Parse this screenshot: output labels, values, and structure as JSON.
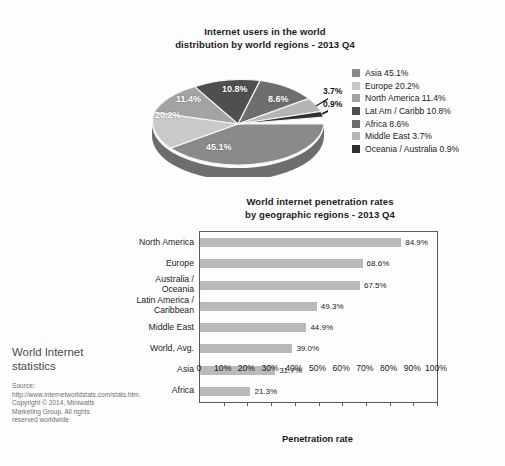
{
  "pie": {
    "title_line1": "Internet users in the world",
    "title_line2": "distribution by world regions - 2013 Q4",
    "slice_labels": {
      "asia": "45.1%",
      "europe": "20.2%",
      "north_america": "11.4%",
      "latam": "10.8%",
      "africa": "8.6%",
      "middle_east": "3.7%",
      "oceania": "0.9%"
    },
    "legend": [
      {
        "label": "Asia 45.1%",
        "color": "#8a8a8a"
      },
      {
        "label": "Europe 20.2%",
        "color": "#c9c9c9"
      },
      {
        "label": "North America 11.4%",
        "color": "#a3a3a3"
      },
      {
        "label": "Lat Am / Caribb 10.8%",
        "color": "#4f4f4f"
      },
      {
        "label": "Africa 8.6%",
        "color": "#6e6e6e"
      },
      {
        "label": "Middle East 3.7%",
        "color": "#b5b5b5"
      },
      {
        "label": "Oceania / Australia 0.9%",
        "color": "#2f2f2f"
      }
    ]
  },
  "bar": {
    "title_line1": "World internet penetration rates",
    "title_line2": "by geographic regions - 2013 Q4",
    "xaxis_title": "Penetration rate"
  },
  "side": {
    "heading": "World Internet statistics",
    "source": "Source: http://www.internetworldstats.com/stats.htm. Copyright © 2014, Miniwatts Marketing Group. All rights reserved worldwide"
  },
  "chart_data": [
    {
      "type": "pie",
      "title": "Internet users in the world distribution by world regions - 2013 Q4",
      "categories": [
        "Asia",
        "Europe",
        "North America",
        "Lat Am / Caribb",
        "Africa",
        "Middle East",
        "Oceania / Australia"
      ],
      "values": [
        45.1,
        20.2,
        11.4,
        10.8,
        8.6,
        3.7,
        0.9
      ],
      "value_labels": [
        "45.1%",
        "20.2%",
        "11.4%",
        "10.8%",
        "8.6%",
        "3.7%",
        "0.9%"
      ],
      "colors": [
        "#8a8a8a",
        "#c9c9c9",
        "#a3a3a3",
        "#4f4f4f",
        "#6e6e6e",
        "#b5b5b5",
        "#2f2f2f"
      ],
      "legend_position": "right",
      "units": "percent of world internet users"
    },
    {
      "type": "bar",
      "orientation": "horizontal",
      "title": "World internet penetration rates by geographic regions - 2013 Q4",
      "xlabel": "Penetration rate",
      "ylabel": "",
      "categories": [
        "North America",
        "Europe",
        "Australia / Oceania",
        "Latin America / Caribbean",
        "Middle East",
        "World, Avg.",
        "Asia",
        "Africa"
      ],
      "values": [
        84.9,
        68.6,
        67.5,
        49.3,
        44.9,
        39.0,
        31.7,
        21.3
      ],
      "value_labels": [
        "84.9%",
        "68.6%",
        "67.5%",
        "49.3%",
        "44.9%",
        "39.0%",
        "31.7%",
        "21.3%"
      ],
      "xlim": [
        0,
        100
      ],
      "xticks": [
        0,
        10,
        20,
        30,
        40,
        50,
        60,
        70,
        80,
        90,
        100
      ],
      "xtick_labels": [
        "0",
        "10%",
        "20%",
        "30%",
        "40%",
        "50%",
        "60%",
        "70%",
        "80%",
        "90%",
        "100%"
      ],
      "grid": false,
      "bar_color": "#b9b9b9"
    }
  ]
}
